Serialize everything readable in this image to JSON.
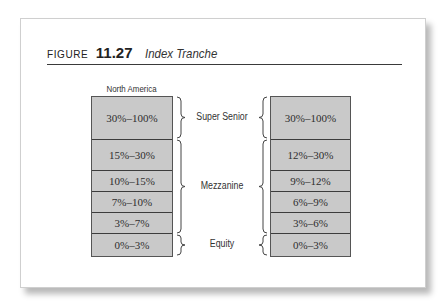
{
  "figure": {
    "label": "FIGURE",
    "number": "11.27",
    "title": "Index Tranche"
  },
  "left_column": {
    "header": "North America",
    "tranches": [
      "30%–100%",
      "15%–30%",
      "10%–15%",
      "7%–10%",
      "3%–7%",
      "0%–3%"
    ]
  },
  "right_column": {
    "header": "",
    "tranches": [
      "30%–100%",
      "12%–30%",
      "9%–12%",
      "6%–9%",
      "3%–6%",
      "0%–3%"
    ]
  },
  "tranche_groups": [
    "Super Senior",
    "Mezzanine",
    "Equity"
  ],
  "colors": {
    "box_fill": "#c9c9c9",
    "box_border": "#3c3c3c",
    "rule": "#3a3a3a"
  }
}
